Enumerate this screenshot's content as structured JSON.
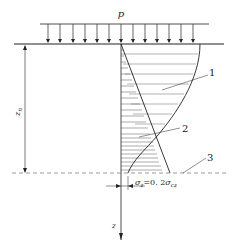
{
  "diagram": {
    "load_label": "p",
    "depth_label": "z",
    "depth_label_sub": "n",
    "axis_label": "z",
    "callouts": [
      {
        "id": "1",
        "label": "1"
      },
      {
        "id": "2",
        "label": "2"
      },
      {
        "id": "3",
        "label": "3"
      }
    ],
    "condition_text": {
      "sigma_z": "σ",
      "sigma_z_sub": "z",
      "equals": "=0. 2",
      "sigma_cz": "σ",
      "sigma_cz_sub": "cz"
    },
    "colors": {
      "line": "#222222",
      "hatch": "#444444",
      "dashed": "#555555"
    }
  }
}
